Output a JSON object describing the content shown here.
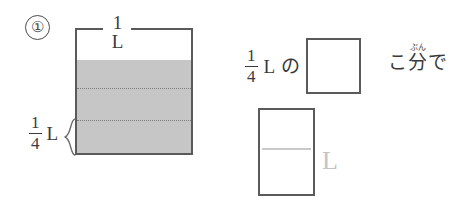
{
  "page": {
    "background_color": "#ffffff",
    "ink_color": "#3a3a3a",
    "line_color": "#5a5a5a",
    "fill_color": "#c6c6c6",
    "faint_color": "#c4c4c4"
  },
  "problem": {
    "number_label": "①"
  },
  "beaker": {
    "capacity_label": "1 L",
    "fraction_left": {
      "numerator": "1",
      "denominator": "4",
      "unit": "L"
    }
  },
  "sentence": {
    "fraction": {
      "numerator": "1",
      "denominator": "4"
    },
    "unit": "L",
    "particle": "の",
    "answer_box_value": "",
    "counter": "こ",
    "kanji": {
      "ruby": "ぶん",
      "base": "分"
    },
    "tail_particle": "で"
  },
  "answer": {
    "box_value": "",
    "unit": "L"
  }
}
